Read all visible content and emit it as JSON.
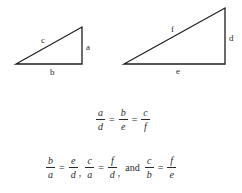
{
  "diagram": {
    "small_triangle": {
      "vertices": [
        [
          16,
          64
        ],
        [
          82,
          64
        ],
        [
          82,
          27
        ]
      ],
      "labels": {
        "hypotenuse": "c",
        "vertical": "a",
        "base": "b"
      }
    },
    "large_triangle": {
      "vertices": [
        [
          124,
          64
        ],
        [
          225,
          64
        ],
        [
          225,
          8
        ]
      ],
      "labels": {
        "hypotenuse": "f",
        "vertical": "d",
        "base": "e"
      }
    },
    "equation1": {
      "fractions": [
        {
          "num": "a",
          "den": "d"
        },
        {
          "num": "b",
          "den": "e"
        },
        {
          "num": "c",
          "den": "f"
        }
      ],
      "equals": "="
    },
    "equation2": {
      "groups": [
        {
          "left": {
            "num": "b",
            "den": "a"
          },
          "right": {
            "num": "e",
            "den": "d"
          },
          "sep": ","
        },
        {
          "left": {
            "num": "c",
            "den": "a"
          },
          "right": {
            "num": "f",
            "den": "d"
          },
          "sep": ","
        },
        {
          "left": {
            "num": "c",
            "den": "b"
          },
          "right": {
            "num": "f",
            "den": "e"
          },
          "sep": ""
        }
      ],
      "conjunction": "and",
      "equals": "="
    }
  }
}
